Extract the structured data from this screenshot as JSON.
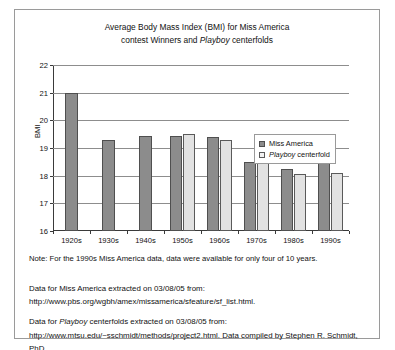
{
  "figure": {
    "title_line1_pre": "Average Body Mass Index (BMI) for Miss America",
    "title_line2_pre": "contest Winners and ",
    "title_line2_italic": "Playboy",
    "title_line2_post": " centerfolds",
    "note": "Note: For the 1990s Miss America data, data were available for only four of 10 years.",
    "source1": "Data for Miss America extracted on 03/08/05 from: http://www.pbs.org/wgbh/amex/missamerica/sfeature/sf_list.html.",
    "source2_pre": "Data for ",
    "source2_italic": "Playboy",
    "source2_post": " centerfolds extracted on 03/08/05 from: http://www.mtsu.edu/~sschmidt/methods/project2.html. Data compiled by Stephen R. Schmidt, PhD."
  },
  "legend": {
    "items": [
      {
        "label": "Miss America",
        "label_italic": "",
        "label_post": "",
        "color": "#8c8c8c"
      },
      {
        "label": "",
        "label_italic": "Playboy",
        "label_post": " centerfold",
        "color": "#e2e2e2"
      }
    ]
  },
  "chart_data": {
    "type": "bar",
    "title": "Average Body Mass Index (BMI) for Miss America contest Winners and Playboy centerfolds",
    "xlabel": "",
    "ylabel": "BMI",
    "ylim": [
      16,
      22
    ],
    "yticks": [
      16,
      17,
      18,
      19,
      20,
      21,
      22
    ],
    "ytick_labels": [
      "16",
      "17",
      "18",
      "19",
      "20",
      "21",
      "22"
    ],
    "grid": true,
    "legend_position": "inside-right",
    "categories": [
      "1920s",
      "1930s",
      "1940s",
      "1950s",
      "1960s",
      "1970s",
      "1980s",
      "1990s"
    ],
    "series": [
      {
        "name": "Miss America",
        "color": "#8c8c8c",
        "values": [
          21.0,
          19.3,
          19.45,
          19.45,
          19.4,
          18.5,
          18.25,
          18.95
        ]
      },
      {
        "name": "Playboy centerfold",
        "color": "#e2e2e2",
        "values": [
          null,
          null,
          null,
          19.5,
          19.3,
          18.7,
          18.05,
          18.1
        ]
      }
    ]
  }
}
